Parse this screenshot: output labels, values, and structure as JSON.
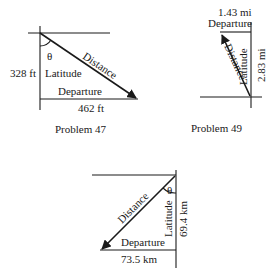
{
  "diagrams": [
    {
      "caption": "Problem 47",
      "labels": {
        "distance": "Distance",
        "latitude": "Latitude",
        "departure": "Departure",
        "angle": "θ",
        "latitude_value": "328 ft",
        "departure_value": "462 ft"
      }
    },
    {
      "caption": "Problem 49",
      "labels": {
        "distance": "Distance",
        "latitude": "Latitude",
        "departure": "Departure",
        "latitude_value": "2.83 mi",
        "departure_value": "1.43 mi"
      }
    },
    {
      "caption": "",
      "labels": {
        "distance": "Distance",
        "latitude": "Latitude",
        "departure": "Departure",
        "angle": "θ",
        "latitude_value": "69.4 km",
        "departure_value": "73.5 km"
      }
    }
  ]
}
